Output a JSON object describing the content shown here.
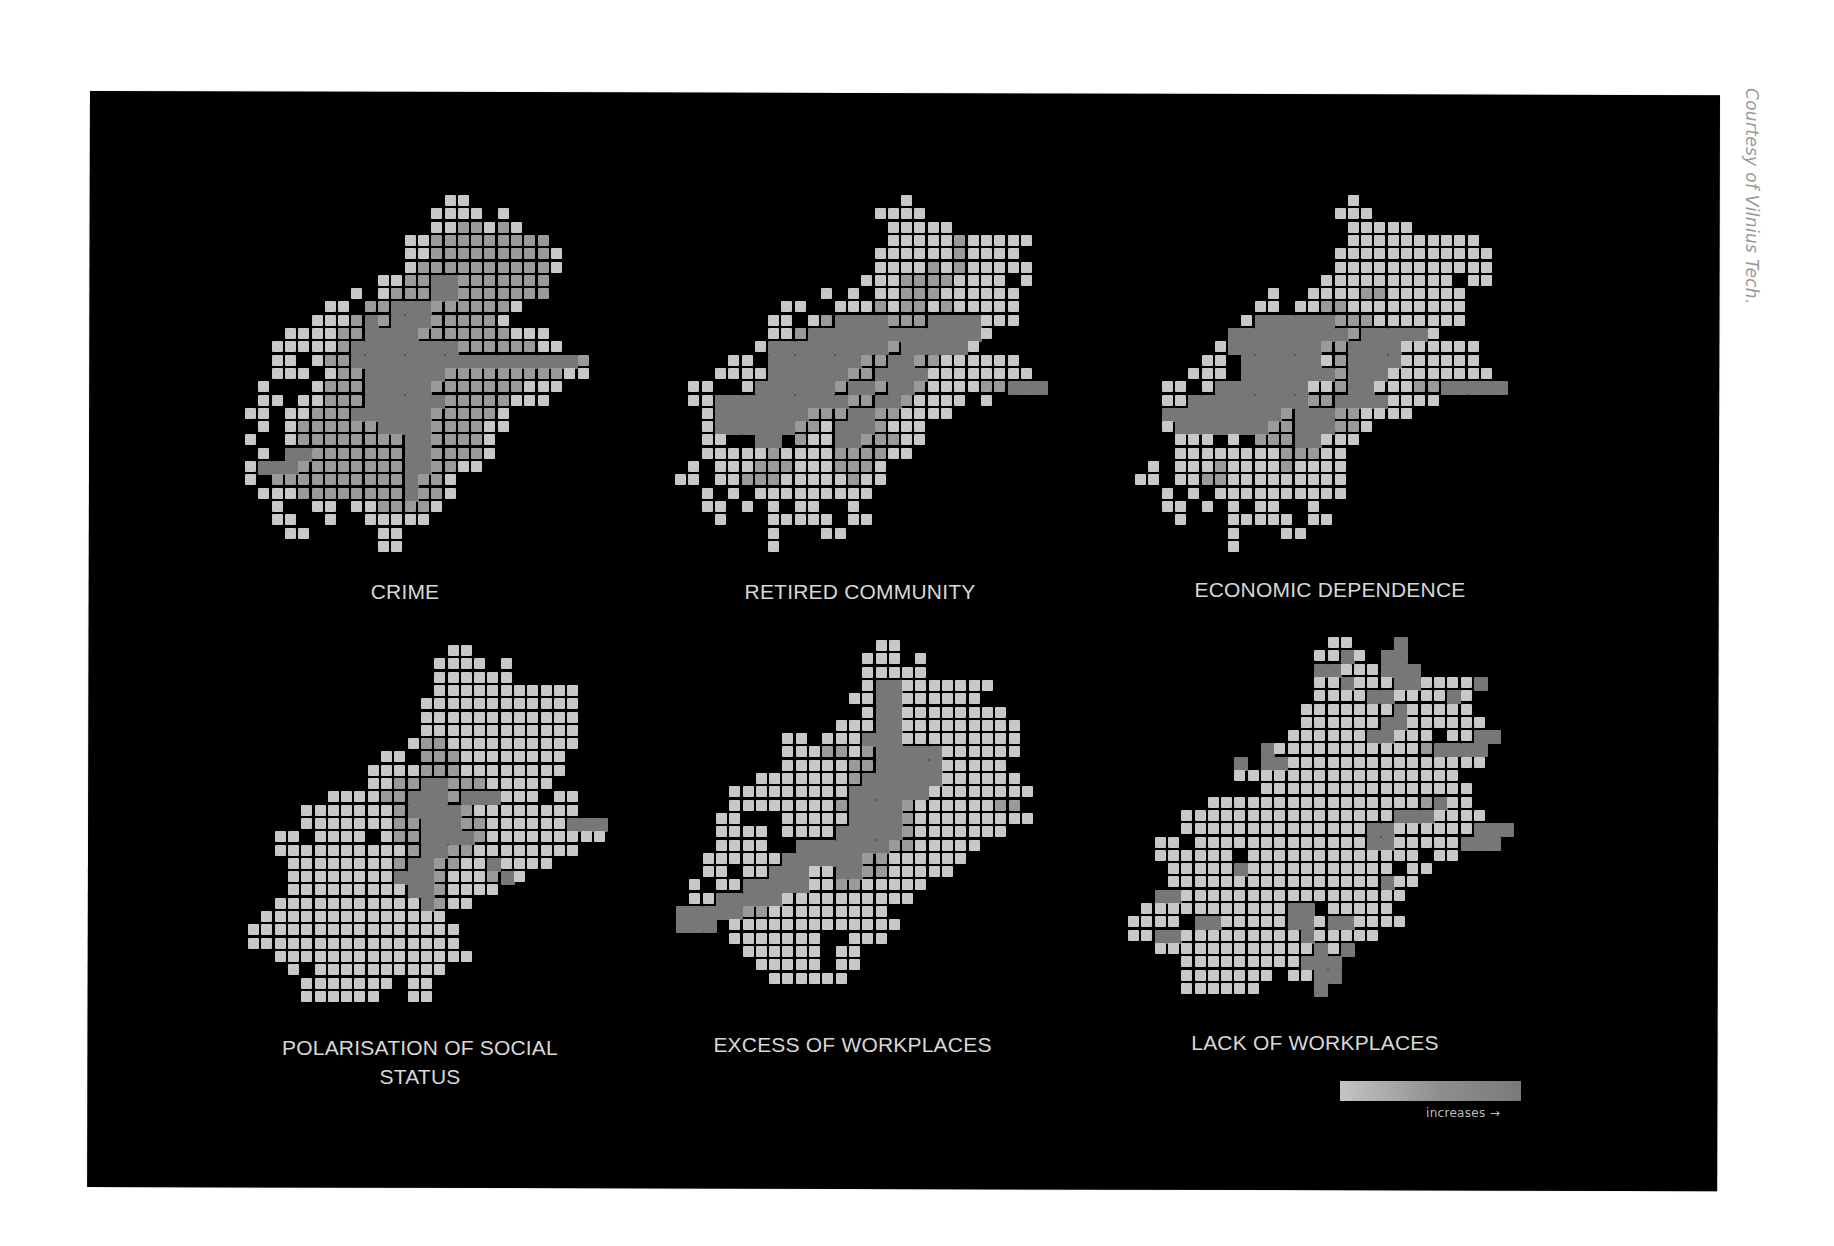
{
  "credit": "Courtesy of Vilnius Tech.",
  "legend": {
    "label": "increases →",
    "gradient_start": "#c4c4c4",
    "gradient_end": "#7a7a7a"
  },
  "chart_data": {
    "type": "heatmap",
    "title": "",
    "legend": {
      "direction": "increases →",
      "scale": "light gray (low) to dark gray (high)"
    },
    "panels": [
      {
        "name": "CRIME",
        "row": 1,
        "col": 1,
        "hotspots": [
          "city centre cross",
          "south-west diagonal",
          "east horizontal"
        ],
        "overall_level": "high"
      },
      {
        "name": "RETIRED COMMUNITY",
        "row": 1,
        "col": 2,
        "hotspots": [
          "centre",
          "west diagonal",
          "east horizontal"
        ],
        "overall_level": "medium"
      },
      {
        "name": "ECONOMIC DEPENDENCE",
        "row": 1,
        "col": 3,
        "hotspots": [
          "centre",
          "west",
          "east long bar"
        ],
        "overall_level": "medium"
      },
      {
        "name": "POLARISATION OF SOCIAL STATUS",
        "row": 2,
        "col": 1,
        "hotspots": [
          "centre cross",
          "east horizontal"
        ],
        "overall_level": "low"
      },
      {
        "name": "EXCESS OF WORKPLACES",
        "row": 2,
        "col": 2,
        "hotspots": [
          "centre",
          "south-west long diagonal",
          "north-east diagonal"
        ],
        "overall_level": "medium"
      },
      {
        "name": "LACK OF WORKPLACES",
        "row": 2,
        "col": 3,
        "hotspots": [
          "north-east diagonals",
          "east horizontal",
          "south vertical"
        ],
        "overall_level": "low"
      }
    ]
  },
  "maps": [
    {
      "id": "crime",
      "label": "CRIME",
      "x": 245,
      "y": 195,
      "label_x": 270,
      "label_y": 578,
      "label_w": 270,
      "rows": [
        "...............11..........",
        "..............1111.1.......",
        "..............1122121......",
        "............11222222222....",
        "............112222222221...",
        "............122222222221...",
        "..........1122332222222....",
        "........1.1222332222222....",
        "......11.223332222221......",
        ".....111232333222221.......",
        "...11112233332222222111....",
        "..1111123333333322222211...",
        "..11.122333333333333333332.",
        "..111.12233333322222222211.",
        ".1...1222333332222222111...",
        ".11.1122233333322222111....",
        "11.11222333333222221.......",
        ".1.12222223333222211.......",
        "1..1222222223322221........",
        ".1.3322222223322221........",
        "133322222222332211.........",
        "1.22222222223221...........",
        ".111222222223221...........",
        "..1..11.1122221............",
        "..11..1..11111.............",
        "...11.....11...............",
        "..........11..............."
      ]
    },
    {
      "id": "retired",
      "label": "RETIRED COMMUNITY",
      "x": 675,
      "y": 195,
      "label_x": 700,
      "label_y": 578,
      "label_w": 320,
      "rows": [
        ".................1..........",
        "...............1111.........",
        "................11111.......",
        "................11111211111.",
        "...............11111121111..",
        "...............111121211111.",
        "..............11122221111.1.",
        "...........1.1.11222111111..",
        "........11..11121221211111..",
        ".......11.1233332223333111..",
        ".......11233333333333331....",
        "......13333333332333331.....",
        "....11.3333333223322111111..",
        "...111133333322333311111111.",
        ".11..13333332332332111122333",
        ".113333333333223321111.1....",
        "..1333333322233221111.......",
        "..13333332213332111.........",
        "..11..33.2113322211.........",
        "..1111121111222211..........",
        ".1.1112221112221............",
        "11.1122211111211............",
        "..1.1.111111111.............",
        "..11.1.1.11..1..............",
        "...1...11111.11.............",
        ".......1...11...............",
        ".......1...................."
      ]
    },
    {
      "id": "economic",
      "label": "ECONOMIC DEPENDENCE",
      "x": 1135,
      "y": 195,
      "label_x": 1150,
      "label_y": 576,
      "label_w": 360,
      "rows": [
        "................1...........",
        "...............111..........",
        "................11111.......",
        "................1111111111..",
        "...............111111111111.",
        "...............111111111111.",
        "..............1111111111.11.",
        "..........1..111122111111...",
        ".........11.1122111111111...",
        "........13333332221111111...",
        ".......3333333332333331.....",
        "......13333333223333111111..",
        ".....11.333333123333111111..",
        "....111.3333333233311111111.",
        "..11.13333333112331112233333",
        "..113333333332233331111.....",
        "..3333333332333221111.......",
        "..1333333322333221..........",
        "...111.1.22233111...........",
        "...1111111122211............",
        ".1.1112111121111............",
        "11.1122111111111............",
        "..1.1.1111111111............",
        "..11.1.1.11..1..............",
        "...1...11111.11.............",
        ".......1...11...............",
        ".......1...................."
      ]
    },
    {
      "id": "polarisation",
      "label": "POLARISATION OF SOCIAL STATUS",
      "x": 248,
      "y": 645,
      "label_x": 240,
      "label_y": 1033,
      "label_w": 380,
      "rows": [
        "...............11...........",
        "..............1111.1........",
        "..............111111........",
        "..............11111111111...",
        ".............111111111111...",
        ".............111111111111...",
        ".............111111111111...",
        "............1221111111111...",
        "..........11.22211111111....",
        ".........111122211111111....",
        ".........11223322211111.....",
        "......1111223332333111.11...",
        "....111111123333211111111...",
        "....11111112233322111111333.",
        "..11.1111.12233332111111111.",
        "..11111111112332211111111...",
        "...11111111233221131111.....",
        "...111111113332111231.......",
        "...1111111113321111.........",
        "..111111111113211...........",
        ".11111111111111.............",
        "1111111111111111............",
        "1111111111111111............",
        "..111111111111111...........",
        "...1.1111111111.............",
        "....1111111.11..............",
        "....111111..11.............."
      ]
    },
    {
      "id": "excess",
      "label": "EXCESS OF WORKPLACES",
      "x": 676,
      "y": 640,
      "label_x": 680,
      "label_y": 1031,
      "label_w": 345,
      "rows": [
        "...............11...........",
        "..............111.1.........",
        "..............11111.........",
        "..............1331111111....",
        ".............1133111111.....",
        "..............13311111111...",
        "............11133111111111..",
        "........11.111333111111111..",
        "........111221233333111111..",
        "........11111223333311111...",
        "......11111112333333111111..",
        "....11111111133333311111111.",
        "....1111111123333211111122..",
        "...11...1111133332111111111.",
        "...1111.11113333321111111...",
        "...1111..33333332211111.....",
        "..11111133333322111111......",
        "..11.1133311332211111.......",
        ".1.1133333112211111.........",
        ".11333331111111111..........",
        "3333322111111111............",
        "333.1111111111111...........",
        "....1111111..111............",
        ".....111111.11..............",
        "......11111.11..............",
        ".......111111..............."
      ]
    },
    {
      "id": "lack",
      "label": "LACK OF WORKPLACES",
      "x": 1128,
      "y": 637,
      "label_x": 1150,
      "label_y": 1029,
      "label_w": 330,
      "rows": [
        "...............11...3........",
        "..............1131.33........",
        "..............33111333.......",
        "..............1131113311113..",
        "..............111133111131...",
        ".............1111111311111...",
        ".............11111133111111..",
        "............11111133111.1133.",
        "..........31111111111123333..",
        "........3.33111111111111111..",
        "........11111111111111111....",
        "..........1111111111111111...",
        "......11111111111111112311...",
        "....11111111111111113331111..",
        "....1111111111111133111111333",
        "..11.11111111111113311111333.",
        "..111111.1111111111111.11....",
        "...11111311111111111.11......",
        "...1111111111111111311.......",
        "..3311111111111111111........",
        ".1111111111133.11111.........",
        "1111.3311111331331111........",
        "1133111111111311111..........",
        "..111111111111313............",
        "....111111111333.............",
        "....1111111.1133.............",
        "....111111....3.............."
      ]
    }
  ]
}
